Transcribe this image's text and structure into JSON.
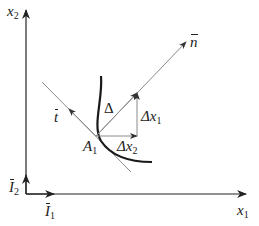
{
  "diagram": {
    "axes": {
      "vertical_label": {
        "base": "x",
        "sub": "2"
      },
      "horizontal_label": {
        "base": "x",
        "sub": "1"
      }
    },
    "basis_vectors": {
      "i2": {
        "base": "I",
        "sub": "2"
      },
      "i1": {
        "base": "I",
        "sub": "1"
      }
    },
    "vectors": {
      "normal": {
        "base": "n"
      },
      "tangent": {
        "base": "t"
      },
      "delta": {
        "symbol": "Δ"
      },
      "delta_x1": {
        "symbol": "Δx",
        "sub": "1"
      },
      "delta_x2": {
        "symbol": "Δx",
        "sub": "2"
      }
    },
    "point": {
      "base": "A",
      "sub": "1"
    },
    "colors": {
      "ink": "#222222",
      "thin_line": "#8a8a8a",
      "curve": "#1a1a1a"
    }
  }
}
